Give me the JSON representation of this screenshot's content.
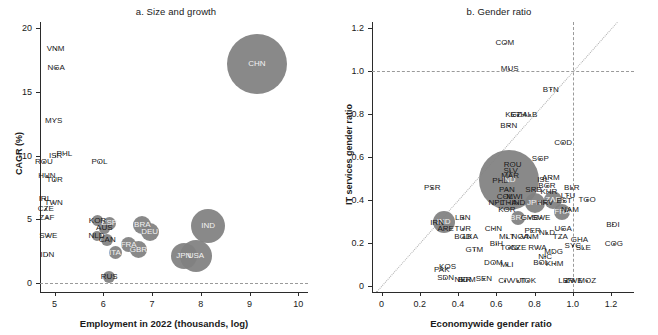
{
  "figure": {
    "panels": [
      {
        "key": "a",
        "title": "a. Size and growth",
        "xlabel": "Employment in 2022 (thousands, log)",
        "ylabel": "CAGR (%)"
      },
      {
        "key": "b",
        "title": "b. Gender ratio",
        "xlabel": "Economywide gender ratio",
        "ylabel": "IT services gender ratio"
      }
    ],
    "colors": {
      "bubble": "#808080",
      "axis": "#2b2b2b",
      "reference_line": "#9a9a9a",
      "diagonal_line": "#b0b0b0",
      "label_light": "#f2f2f2"
    }
  },
  "chart_data": [
    {
      "type": "scatter",
      "panel": "a",
      "title": "a. Size and growth",
      "xlabel": "Employment in 2022 (thousands, log)",
      "ylabel": "CAGR (%)",
      "xlim": [
        4.7,
        10.2
      ],
      "ylim": [
        -0.7,
        20.5
      ],
      "xticks": [
        "5",
        "6",
        "7",
        "8",
        "9",
        "10"
      ],
      "yticks": [
        "0",
        "5",
        "10",
        "15",
        "20"
      ],
      "grid": false,
      "reference_lines": [
        {
          "axis": "y",
          "value": 0,
          "style": "dashed"
        }
      ],
      "size_encodes": "employment (bubble area)",
      "points": [
        {
          "label": "VNM",
          "x": 5.02,
          "y": 18.4,
          "r": 0
        },
        {
          "label": "NGA",
          "x": 5.03,
          "y": 16.9,
          "r": 0
        },
        {
          "label": "MYS",
          "x": 4.98,
          "y": 12.7,
          "r": 0
        },
        {
          "label": "ISR",
          "x": 5.02,
          "y": 10.0,
          "r": 0
        },
        {
          "label": "PHL",
          "x": 5.2,
          "y": 10.1,
          "r": 0
        },
        {
          "label": "ROU",
          "x": 4.78,
          "y": 9.5,
          "r": 0
        },
        {
          "label": "POL",
          "x": 5.92,
          "y": 9.5,
          "r": 0
        },
        {
          "label": "HUN",
          "x": 4.84,
          "y": 8.4,
          "r": 0
        },
        {
          "label": "TUR",
          "x": 5.0,
          "y": 8.1,
          "r": 0
        },
        {
          "label": "IRL",
          "x": 4.8,
          "y": 6.6,
          "r": 0
        },
        {
          "label": "TWN",
          "x": 4.98,
          "y": 6.3,
          "r": 0
        },
        {
          "label": "CZE",
          "x": 4.82,
          "y": 5.8,
          "r": 0
        },
        {
          "label": "ZAF",
          "x": 4.84,
          "y": 5.1,
          "r": 0
        },
        {
          "label": "KOR",
          "x": 5.88,
          "y": 4.9,
          "r": 5.5
        },
        {
          "label": "ESP",
          "x": 6.12,
          "y": 4.7,
          "r": 6.5
        },
        {
          "label": "AUS",
          "x": 6.02,
          "y": 4.3,
          "r": 5.5
        },
        {
          "label": "NLD",
          "x": 5.86,
          "y": 3.7,
          "r": 5
        },
        {
          "label": "CAN",
          "x": 6.08,
          "y": 3.4,
          "r": 6
        },
        {
          "label": "BRA",
          "x": 6.8,
          "y": 4.6,
          "r": 9
        },
        {
          "label": "DEU",
          "x": 6.95,
          "y": 4.0,
          "r": 9
        },
        {
          "label": "FRA",
          "x": 6.52,
          "y": 3.0,
          "r": 7.5
        },
        {
          "label": "GBR",
          "x": 6.72,
          "y": 2.6,
          "r": 8.5
        },
        {
          "label": "ITA",
          "x": 6.24,
          "y": 2.4,
          "r": 6.5
        },
        {
          "label": "SWE",
          "x": 4.87,
          "y": 3.7,
          "r": 0
        },
        {
          "label": "IDN",
          "x": 4.85,
          "y": 2.2,
          "r": 0
        },
        {
          "label": "RUS",
          "x": 6.12,
          "y": 0.5,
          "r": 6
        },
        {
          "label": "JPN",
          "x": 7.65,
          "y": 2.1,
          "r": 13
        },
        {
          "label": "USA",
          "x": 7.9,
          "y": 2.1,
          "r": 16
        },
        {
          "label": "IND",
          "x": 8.15,
          "y": 4.5,
          "r": 17
        },
        {
          "label": "CHN",
          "x": 9.15,
          "y": 17.2,
          "r": 30
        }
      ]
    },
    {
      "type": "scatter",
      "panel": "b",
      "title": "b. Gender ratio",
      "xlabel": "Economywide gender ratio",
      "ylabel": "IT services gender ratio",
      "xlim": [
        -0.05,
        1.32
      ],
      "ylim": [
        -0.03,
        1.23
      ],
      "xticks": [
        "0",
        "0.2",
        "0.4",
        "0.6",
        "0.8",
        "1.0",
        "1.2"
      ],
      "yticks": [
        "0",
        "0.2",
        "0.4",
        "0.6",
        "0.8",
        "1.0",
        "1.2"
      ],
      "grid": false,
      "reference_lines": [
        {
          "axis": "y",
          "value": 1.0,
          "style": "dashed"
        },
        {
          "axis": "x",
          "value": 1.0,
          "style": "dashed"
        },
        {
          "axis": "diagonal",
          "value": "y = x",
          "style": "dotted"
        }
      ],
      "size_encodes": "IT services employment (bubble area)",
      "points": [
        {
          "label": "COM",
          "x": 0.645,
          "y": 1.13,
          "r": 0
        },
        {
          "label": "MUS",
          "x": 0.67,
          "y": 1.01,
          "r": 0
        },
        {
          "label": "BTN",
          "x": 0.885,
          "y": 0.915,
          "r": 0
        },
        {
          "label": "KGZ",
          "x": 0.69,
          "y": 0.795,
          "r": 0
        },
        {
          "label": "ETH",
          "x": 0.715,
          "y": 0.795,
          "r": 0
        },
        {
          "label": "ALB",
          "x": 0.775,
          "y": 0.795,
          "r": 0
        },
        {
          "label": "BRN",
          "x": 0.665,
          "y": 0.745,
          "r": 0
        },
        {
          "label": "COD",
          "x": 0.95,
          "y": 0.665,
          "r": 0
        },
        {
          "label": "SGP",
          "x": 0.83,
          "y": 0.59,
          "r": 0
        },
        {
          "label": "ROU",
          "x": 0.685,
          "y": 0.565,
          "r": 0
        },
        {
          "label": "SLV",
          "x": 0.675,
          "y": 0.535,
          "r": 0
        },
        {
          "label": "MAR",
          "x": 0.672,
          "y": 0.51,
          "r": 0
        },
        {
          "label": "PHL",
          "x": 0.62,
          "y": 0.49,
          "r": 0
        },
        {
          "label": "IND",
          "x": 0.665,
          "y": 0.495,
          "r": 30
        },
        {
          "label": "ISL",
          "x": 0.845,
          "y": 0.495,
          "r": 0
        },
        {
          "label": "ARM",
          "x": 0.885,
          "y": 0.5,
          "r": 0
        },
        {
          "label": "PAN",
          "x": 0.655,
          "y": 0.445,
          "r": 0
        },
        {
          "label": "SRB",
          "x": 0.795,
          "y": 0.445,
          "r": 0
        },
        {
          "label": "BGR",
          "x": 0.865,
          "y": 0.465,
          "r": 0
        },
        {
          "label": "KHR",
          "x": 0.875,
          "y": 0.435,
          "r": 0
        },
        {
          "label": "BLR",
          "x": 0.995,
          "y": 0.455,
          "r": 0
        },
        {
          "label": "COL",
          "x": 0.645,
          "y": 0.415,
          "r": 0
        },
        {
          "label": "MWI",
          "x": 0.695,
          "y": 0.415,
          "r": 0
        },
        {
          "label": "LTU",
          "x": 0.975,
          "y": 0.42,
          "r": 0
        },
        {
          "label": "NPL",
          "x": 0.6,
          "y": 0.385,
          "r": 0
        },
        {
          "label": "THA",
          "x": 0.665,
          "y": 0.385,
          "r": 0
        },
        {
          "label": "IND2",
          "x": 0.715,
          "y": 0.385,
          "r": 0
        },
        {
          "label": "JPN",
          "x": 0.8,
          "y": 0.385,
          "r": 10
        },
        {
          "label": "HRV",
          "x": 0.855,
          "y": 0.385,
          "r": 0
        },
        {
          "label": "ZAF",
          "x": 0.895,
          "y": 0.4,
          "r": 9
        },
        {
          "label": "EST",
          "x": 0.955,
          "y": 0.395,
          "r": 0
        },
        {
          "label": "TGO",
          "x": 1.075,
          "y": 0.4,
          "r": 0
        },
        {
          "label": "KOR",
          "x": 0.655,
          "y": 0.355,
          "r": 0
        },
        {
          "label": "FRA",
          "x": 0.945,
          "y": 0.345,
          "r": 8
        },
        {
          "label": "NAM",
          "x": 0.985,
          "y": 0.355,
          "r": 0
        },
        {
          "label": "BRA",
          "x": 0.715,
          "y": 0.315,
          "r": 7
        },
        {
          "label": "GMB",
          "x": 0.775,
          "y": 0.315,
          "r": 0
        },
        {
          "label": "SWE",
          "x": 0.835,
          "y": 0.315,
          "r": 0
        },
        {
          "label": "LBN",
          "x": 0.425,
          "y": 0.315,
          "r": 0
        },
        {
          "label": "IRN",
          "x": 0.29,
          "y": 0.29,
          "r": 0
        },
        {
          "label": "IND3",
          "x": 0.325,
          "y": 0.295,
          "r": 11
        },
        {
          "label": "ARE",
          "x": 0.335,
          "y": 0.265,
          "r": 0
        },
        {
          "label": "BDI",
          "x": 1.21,
          "y": 0.285,
          "r": 0
        },
        {
          "label": "TUR",
          "x": 0.425,
          "y": 0.265,
          "r": 0
        },
        {
          "label": "CHN",
          "x": 0.585,
          "y": 0.265,
          "r": 0
        },
        {
          "label": "PER",
          "x": 0.79,
          "y": 0.255,
          "r": 0
        },
        {
          "label": "UGA",
          "x": 0.95,
          "y": 0.265,
          "r": 0
        },
        {
          "label": "NLD",
          "x": 0.865,
          "y": 0.245,
          "r": 0
        },
        {
          "label": "TZA",
          "x": 0.935,
          "y": 0.225,
          "r": 0
        },
        {
          "label": "BGD",
          "x": 0.425,
          "y": 0.225,
          "r": 0
        },
        {
          "label": "LKA",
          "x": 0.465,
          "y": 0.225,
          "r": 0
        },
        {
          "label": "BIH",
          "x": 0.6,
          "y": 0.195,
          "r": 0
        },
        {
          "label": "MLT",
          "x": 0.655,
          "y": 0.225,
          "r": 0
        },
        {
          "label": "NGA",
          "x": 0.725,
          "y": 0.225,
          "r": 0
        },
        {
          "label": "VNM",
          "x": 0.775,
          "y": 0.225,
          "r": 0
        },
        {
          "label": "GHA",
          "x": 1.035,
          "y": 0.215,
          "r": 0
        },
        {
          "label": "COG",
          "x": 1.215,
          "y": 0.195,
          "r": 0
        },
        {
          "label": "SYC",
          "x": 1.0,
          "y": 0.185,
          "r": 0
        },
        {
          "label": "SLE",
          "x": 1.055,
          "y": 0.175,
          "r": 0
        },
        {
          "label": "GTM",
          "x": 0.485,
          "y": 0.165,
          "r": 0
        },
        {
          "label": "TON",
          "x": 0.665,
          "y": 0.175,
          "r": 0
        },
        {
          "label": "CZE",
          "x": 0.715,
          "y": 0.175,
          "r": 0
        },
        {
          "label": "RWA",
          "x": 0.815,
          "y": 0.175,
          "r": 0
        },
        {
          "label": "MDG",
          "x": 0.9,
          "y": 0.155,
          "r": 0
        },
        {
          "label": "NIC",
          "x": 0.855,
          "y": 0.135,
          "r": 0
        },
        {
          "label": "DOM",
          "x": 0.585,
          "y": 0.105,
          "r": 0
        },
        {
          "label": "MLI",
          "x": 0.655,
          "y": 0.095,
          "r": 0
        },
        {
          "label": "BOL",
          "x": 0.835,
          "y": 0.105,
          "r": 0
        },
        {
          "label": "KHM",
          "x": 0.905,
          "y": 0.1,
          "r": 0
        },
        {
          "label": "PAK",
          "x": 0.315,
          "y": 0.075,
          "r": 0
        },
        {
          "label": "KOS",
          "x": 0.345,
          "y": 0.085,
          "r": 0
        },
        {
          "label": "SDN",
          "x": 0.335,
          "y": 0.035,
          "r": 0
        },
        {
          "label": "NER",
          "x": 0.425,
          "y": 0.025,
          "r": 0
        },
        {
          "label": "BDM",
          "x": 0.445,
          "y": 0.025,
          "r": 0
        },
        {
          "label": "SEN",
          "x": 0.535,
          "y": 0.03,
          "r": 0
        },
        {
          "label": "CIV",
          "x": 0.645,
          "y": 0.02,
          "r": 0
        },
        {
          "label": "VUT",
          "x": 0.715,
          "y": 0.02,
          "r": 0
        },
        {
          "label": "TOK",
          "x": 0.765,
          "y": 0.02,
          "r": 0
        },
        {
          "label": "LBR",
          "x": 0.965,
          "y": 0.02,
          "r": 0
        },
        {
          "label": "ZWE",
          "x": 1.005,
          "y": 0.02,
          "r": 0
        },
        {
          "label": "MOZ",
          "x": 1.075,
          "y": 0.02,
          "r": 0
        },
        {
          "label": "PSR",
          "x": 0.265,
          "y": 0.455,
          "r": 0
        }
      ]
    }
  ]
}
